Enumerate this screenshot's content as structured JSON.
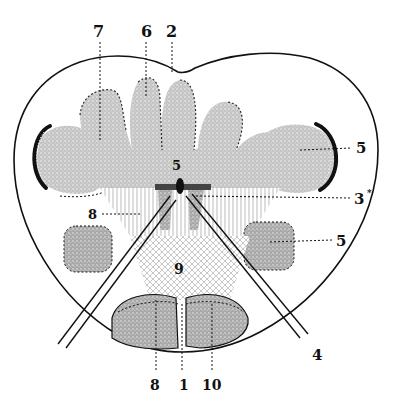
{
  "figure": {
    "type": "anatomical cross-section",
    "colors": {
      "ink": "#111111",
      "gray_fill": "#bdbdbd",
      "gray_dark": "#a8a8a8",
      "paper": "#ffffff"
    },
    "labels": [
      {
        "id": "l7",
        "text": "7",
        "x": 100,
        "y": 37
      },
      {
        "id": "l6",
        "text": "6",
        "x": 146,
        "y": 37
      },
      {
        "id": "l2",
        "text": "2",
        "x": 172,
        "y": 37
      },
      {
        "id": "l5a",
        "text": "5",
        "x": 358,
        "y": 152
      },
      {
        "id": "l5c",
        "text": "5",
        "x": 170,
        "y": 168
      },
      {
        "id": "l3",
        "text": "3",
        "x": 356,
        "y": 203
      },
      {
        "id": "l3s",
        "text": "*",
        "x": 368,
        "y": 195
      },
      {
        "id": "l8a",
        "text": "8",
        "x": 90,
        "y": 218
      },
      {
        "id": "l5b",
        "text": "5",
        "x": 338,
        "y": 244
      },
      {
        "id": "l9",
        "text": "9",
        "x": 175,
        "y": 272
      },
      {
        "id": "l4",
        "text": "4",
        "x": 314,
        "y": 360
      },
      {
        "id": "l8b",
        "text": "8",
        "x": 152,
        "y": 388
      },
      {
        "id": "l1",
        "text": "1",
        "x": 181,
        "y": 388
      },
      {
        "id": "l10",
        "text": "10",
        "x": 204,
        "y": 388
      }
    ]
  }
}
